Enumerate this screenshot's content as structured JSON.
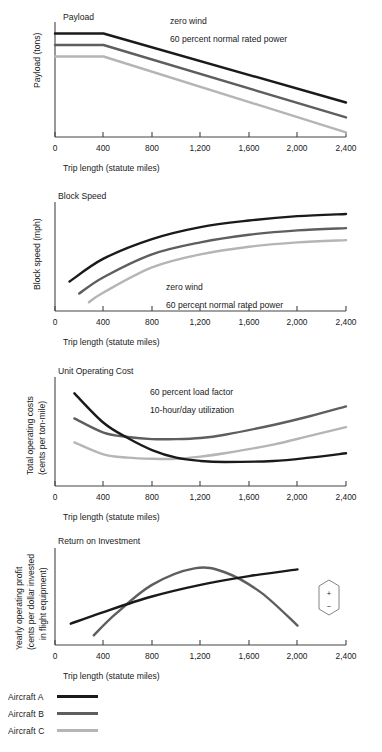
{
  "figure": {
    "xlabel": "Trip length (statute miles)",
    "xticks": [
      "0",
      "400",
      "800",
      "1,200",
      "1,600",
      "2,000",
      "2,400"
    ],
    "xtick_values": [
      0,
      400,
      800,
      1200,
      1600,
      2000,
      2400
    ],
    "colors": {
      "aircraft_a": "#1a1a1a",
      "aircraft_b": "#5e5e5e",
      "aircraft_c": "#b5b5b5",
      "axis": "#444444",
      "background": "#ffffff"
    }
  },
  "legend": {
    "items": [
      {
        "label": "Aircraft A",
        "color": "#1a1a1a"
      },
      {
        "label": "Aircraft B",
        "color": "#5e5e5e"
      },
      {
        "label": "Aircraft C",
        "color": "#b5b5b5"
      }
    ]
  },
  "marker": {
    "plus": "+",
    "minus": "−"
  },
  "chart_data": [
    {
      "type": "line",
      "title": "Payload",
      "ylabel": "Payload (tons)",
      "xlabel": "Trip length (statute miles)",
      "xticks": [
        "0",
        "400",
        "800",
        "1,200",
        "1,600",
        "2,000",
        "2,400"
      ],
      "xlim": [
        0,
        2400
      ],
      "ylim": [
        0,
        100
      ],
      "grid": false,
      "annotations": [
        "zero wind",
        "60 percent normal rated power"
      ],
      "series": [
        {
          "name": "Aircraft A",
          "color": "#1a1a1a",
          "x": [
            0,
            400,
            2400
          ],
          "y": [
            90,
            90,
            30
          ]
        },
        {
          "name": "Aircraft B",
          "color": "#5e5e5e",
          "x": [
            0,
            400,
            2400
          ],
          "y": [
            80,
            80,
            17
          ]
        },
        {
          "name": "Aircraft C",
          "color": "#b5b5b5",
          "x": [
            0,
            400,
            2400
          ],
          "y": [
            70,
            70,
            4
          ]
        }
      ]
    },
    {
      "type": "line",
      "title": "Block Speed",
      "ylabel": "Block speed (mph)",
      "xlabel": "Trip length (statute miles)",
      "xticks": [
        "0",
        "400",
        "800",
        "1,200",
        "1,600",
        "2,000",
        "2,400"
      ],
      "xlim": [
        0,
        2400
      ],
      "ylim": [
        0,
        100
      ],
      "grid": false,
      "annotations": [
        "zero wind",
        "60 percent normal rated power"
      ],
      "series": [
        {
          "name": "Aircraft A",
          "color": "#1a1a1a",
          "x": [
            120,
            400,
            800,
            1200,
            1600,
            2000,
            2400
          ],
          "y": [
            27,
            48,
            66,
            77,
            83,
            87,
            89
          ]
        },
        {
          "name": "Aircraft B",
          "color": "#5e5e5e",
          "x": [
            200,
            400,
            800,
            1200,
            1600,
            2000,
            2400
          ],
          "y": [
            16,
            31,
            52,
            63,
            70,
            74,
            76
          ]
        },
        {
          "name": "Aircraft C",
          "color": "#b5b5b5",
          "x": [
            280,
            400,
            800,
            1200,
            1600,
            2000,
            2400
          ],
          "y": [
            8,
            17,
            40,
            52,
            59,
            63,
            65
          ]
        }
      ]
    },
    {
      "type": "line",
      "title": "Unit Operating Cost",
      "ylabel": "Total operating costs\n(cents per ton-mile)",
      "ylabel_lines": [
        "Total operating costs",
        "(cents per ton-mile)"
      ],
      "xlabel": "Trip length (statute miles)",
      "xticks": [
        "0",
        "400",
        "800",
        "1,200",
        "1,600",
        "2,000",
        "2,400"
      ],
      "xlim": [
        0,
        2400
      ],
      "ylim": [
        0,
        100
      ],
      "grid": false,
      "annotations": [
        "60 percent load factor",
        "10-hour/day utilization"
      ],
      "series": [
        {
          "name": "Aircraft A",
          "color": "#1a1a1a",
          "x": [
            160,
            400,
            600,
            800,
            1000,
            1200,
            1400,
            1800,
            2100,
            2400
          ],
          "y": [
            85,
            58,
            44,
            33,
            26,
            23,
            22,
            23,
            26,
            30
          ]
        },
        {
          "name": "Aircraft B",
          "color": "#5e5e5e",
          "x": [
            160,
            400,
            600,
            800,
            1000,
            1200,
            1400,
            1800,
            2100,
            2400
          ],
          "y": [
            62,
            49,
            45,
            43,
            43,
            44,
            47,
            56,
            64,
            73
          ]
        },
        {
          "name": "Aircraft C",
          "color": "#b5b5b5",
          "x": [
            160,
            400,
            600,
            800,
            1000,
            1200,
            1400,
            1800,
            2100,
            2400
          ],
          "y": [
            40,
            29,
            26,
            25,
            25,
            27,
            30,
            38,
            46,
            54
          ]
        }
      ]
    },
    {
      "type": "line",
      "title": "Return on Investment",
      "ylabel": "Yearly operating profit\n(cents per dollar invested\nin flight equipment)",
      "ylabel_lines": [
        "Yearly operating profit",
        "(cents per dollar invested",
        "in flight equipment)"
      ],
      "xlabel": "Trip length (statute miles)",
      "xticks": [
        "0",
        "400",
        "800",
        "1,200",
        "1,600",
        "2,000",
        "2,400"
      ],
      "xlim": [
        0,
        2400
      ],
      "ylim": [
        0,
        100
      ],
      "grid": false,
      "annotations": [],
      "series": [
        {
          "name": "Aircraft A",
          "color": "#1a1a1a",
          "x": [
            130,
            400,
            800,
            1200,
            1600,
            2000
          ],
          "y": [
            22,
            34,
            50,
            62,
            71,
            78
          ]
        },
        {
          "name": "Aircraft B",
          "color": "#5e5e5e",
          "x": [
            320,
            500,
            800,
            1150,
            1400,
            1700,
            2000
          ],
          "y": [
            10,
            32,
            62,
            79,
            75,
            54,
            20
          ]
        }
      ]
    }
  ]
}
